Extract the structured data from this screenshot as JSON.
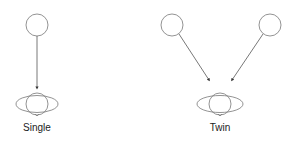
{
  "diagram": {
    "stroke_color": "#777777",
    "panels": [
      {
        "label": "Single",
        "sources": [
          {
            "cx": 37,
            "cy": 25,
            "r": 11
          }
        ],
        "arrows": [
          {
            "x1": 37,
            "y1": 36,
            "x2": 37,
            "y2": 88
          }
        ],
        "target": {
          "cx": 37,
          "cy": 104,
          "rx": 21,
          "ry": 8.5,
          "r": 11
        }
      },
      {
        "label": "Twin",
        "sources": [
          {
            "cx": 172,
            "cy": 25,
            "r": 11
          },
          {
            "cx": 270,
            "cy": 25,
            "r": 11
          }
        ],
        "arrows": [
          {
            "x1": 179,
            "y1": 34,
            "x2": 209,
            "y2": 80
          },
          {
            "x1": 263,
            "y1": 34,
            "x2": 232,
            "y2": 80
          }
        ],
        "target": {
          "cx": 220,
          "cy": 104,
          "rx": 23,
          "ry": 8.5,
          "r": 11
        }
      }
    ]
  },
  "labels": {
    "single": "Single",
    "twin": "Twin"
  }
}
